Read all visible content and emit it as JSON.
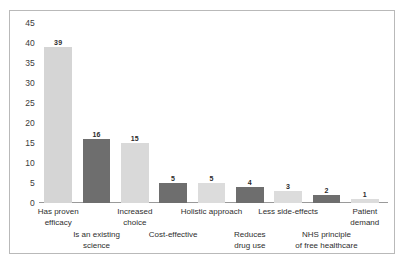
{
  "chart_data": {
    "type": "bar",
    "title": "",
    "subtitle": "",
    "xlabel": "",
    "ylabel": "",
    "ylim": [
      0,
      45
    ],
    "yticks": [
      45,
      40,
      35,
      30,
      25,
      20,
      15,
      10,
      5,
      0
    ],
    "grid": false,
    "legend": "none",
    "categories": [
      "Has proven\nefficacy",
      "Is an existing\nscience",
      "Increased\nchoice",
      "Cost-effective",
      "Holistic approach",
      "Reduces\ndrug use",
      "Less side-effects",
      "NHS principle\nof free healthcare",
      "Patient\ndemand"
    ],
    "values": [
      39,
      16,
      15,
      5,
      5,
      4,
      3,
      2,
      1
    ],
    "value_labels": [
      "39",
      "16",
      "15",
      "5",
      "5",
      "4",
      "3",
      "2",
      "1"
    ],
    "bar_colors": [
      "#d5d5d5",
      "#6e6e6e",
      "#d9d9d9",
      "#6e6e6e",
      "#dcdcdc",
      "#6e6e6e",
      "#dcdcdc",
      "#6e6e6e",
      "#dcdcdc"
    ]
  },
  "figure": {
    "border_color": "#b9b9b9",
    "background": "#ffffff",
    "axis_color": "#9a9a9a"
  }
}
